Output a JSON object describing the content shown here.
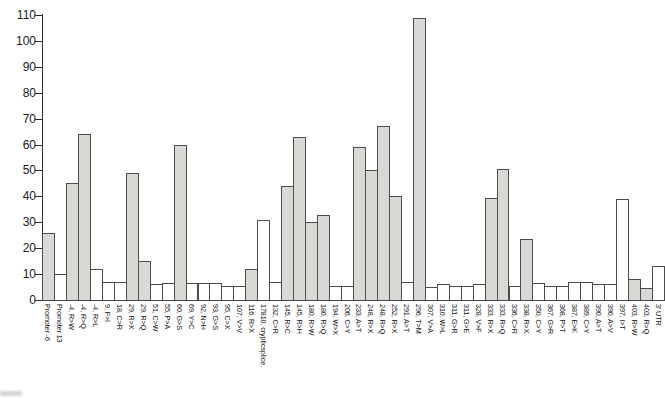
{
  "chart_data": {
    "type": "bar",
    "title": "",
    "xlabel": "",
    "ylabel": "",
    "ylim": [
      0,
      110
    ],
    "yticks": [
      0,
      10,
      20,
      30,
      40,
      50,
      60,
      70,
      80,
      90,
      100,
      110
    ],
    "grid": false,
    "legend": false,
    "categories": [
      "Promoter -6",
      "Promoter 13",
      "-4, R>W",
      "-4, R>Q",
      "-4, R>L",
      "9, F>I",
      "18, C>R",
      "29, R>X",
      "29, R>Q",
      "51, C>W",
      "55, P>A",
      "60, G>S",
      "69, Y>C",
      "92, N>H",
      "93, G>S",
      "95, C>X",
      "107, V>V",
      "116, R>X",
      "17810, crypticsplice",
      "132, C>R",
      "145, R>C",
      "145, R>H",
      "180, R>W",
      "180, R>Q",
      "194, W>X",
      "206, C>Y",
      "233, A>T",
      "248, R>X",
      "248, R>Q",
      "252, R>X",
      "291, A>T",
      "296, T>M",
      "307, V>A",
      "310, W>L",
      "311, G>R",
      "311, G>E",
      "328, V>F",
      "333, R>X",
      "333, R>Q",
      "336, C>R",
      "338, R>X",
      "350, C>Y",
      "367, G>R",
      "368, P>T",
      "387, E>K",
      "389, C>Y",
      "390, A>T",
      "390, A>V",
      "397, I>T",
      "403, R>W",
      "403, R>Q",
      "3' UTR"
    ],
    "values": [
      26,
      10,
      45,
      64,
      12,
      7,
      7,
      49,
      15,
      6,
      6.5,
      60,
      6.5,
      6.5,
      6.5,
      5.5,
      5.5,
      12,
      31,
      7,
      44,
      63,
      30,
      33,
      5.5,
      5.5,
      59,
      50,
      67,
      40,
      7,
      109,
      5,
      6,
      5.5,
      5.5,
      6,
      39.5,
      50.5,
      5.5,
      23.5,
      6.5,
      5.5,
      5.5,
      7,
      7,
      6,
      6,
      39,
      8,
      4.5,
      13
    ],
    "filled": [
      true,
      false,
      true,
      true,
      false,
      false,
      false,
      true,
      true,
      false,
      false,
      true,
      false,
      false,
      false,
      false,
      false,
      true,
      false,
      false,
      true,
      true,
      true,
      true,
      false,
      false,
      true,
      true,
      true,
      true,
      false,
      true,
      false,
      false,
      false,
      false,
      false,
      true,
      true,
      false,
      true,
      false,
      false,
      false,
      false,
      false,
      false,
      false,
      false,
      true,
      true,
      false
    ],
    "bar_fill_color": "#d8d9d4",
    "bar_empty_color": "#ffffff",
    "bar_border_color": "#4c4c4c",
    "axis_color": "#2c2c2c"
  }
}
